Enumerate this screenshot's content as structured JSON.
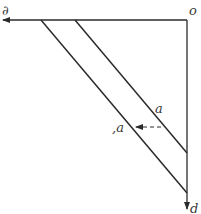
{
  "diagram": {
    "labels": {
      "horizontal_axis": "∂",
      "origin": "o",
      "vertical_axis": "d",
      "line_upper": "a",
      "line_lower": ",a"
    },
    "colors": {
      "line": "#2a2a2a",
      "background": "#ffffff",
      "text": "#3a3a3a"
    }
  }
}
